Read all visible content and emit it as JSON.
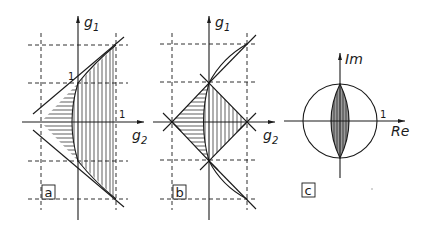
{
  "figure": {
    "panels": [
      {
        "id": "a",
        "tag": "a",
        "axis_x_label": "g",
        "axis_x_sub": "2",
        "axis_y_label": "g",
        "axis_y_sub": "1",
        "tick_y": "1",
        "tick_x": "1",
        "description": "Triangle region with horizontal hatching (left) and vertical hatching (right of parabola)"
      },
      {
        "id": "b",
        "tag": "b",
        "axis_x_label": "g",
        "axis_x_sub": "2",
        "axis_y_label": "g",
        "axis_y_sub": "1",
        "description": "Diamond region split by parabola: horizontal hatching left, vertical hatching right"
      },
      {
        "id": "c",
        "tag": "c",
        "axis_x_label": "Re",
        "axis_y_label": "Im",
        "tick_x": "1",
        "description": "Unit circle with hatched lens region along imaginary axis"
      }
    ],
    "colors": {
      "ink": "#1a1a1a",
      "background": "#ffffff"
    }
  }
}
